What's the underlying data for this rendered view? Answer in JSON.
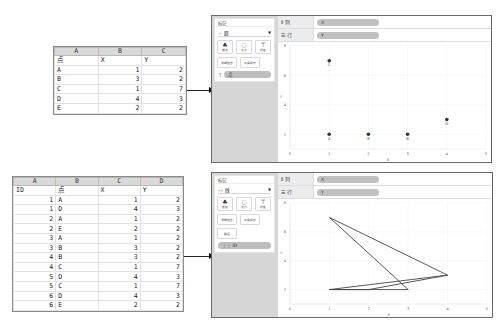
{
  "sheet1": {
    "columns": [
      "A",
      "B",
      "C"
    ],
    "rows": [
      [
        "点",
        "X",
        "Y"
      ],
      [
        "A",
        "1",
        "2"
      ],
      [
        "B",
        "3",
        "2"
      ],
      [
        "C",
        "1",
        "7"
      ],
      [
        "D",
        "4",
        "3"
      ],
      [
        "E",
        "2",
        "2"
      ]
    ]
  },
  "sheet2": {
    "columns": [
      "A",
      "B",
      "C",
      "D"
    ],
    "rows": [
      [
        "ID",
        "点",
        "X",
        "Y"
      ],
      [
        "1",
        "A",
        "1",
        "2"
      ],
      [
        "1",
        "D",
        "4",
        "3"
      ],
      [
        "2",
        "A",
        "1",
        "2"
      ],
      [
        "2",
        "E",
        "2",
        "2"
      ],
      [
        "3",
        "A",
        "1",
        "2"
      ],
      [
        "3",
        "B",
        "3",
        "2"
      ],
      [
        "4",
        "B",
        "3",
        "2"
      ],
      [
        "4",
        "C",
        "1",
        "7"
      ],
      [
        "5",
        "D",
        "4",
        "3"
      ],
      [
        "5",
        "C",
        "1",
        "7"
      ],
      [
        "6",
        "D",
        "4",
        "3"
      ],
      [
        "6",
        "E",
        "2",
        "2"
      ]
    ]
  },
  "panel1": {
    "marks_title": "标记",
    "mark_type": "圆",
    "mark_type_icon": "scatter-icon",
    "buttons": [
      {
        "icon": "color-icon",
        "label": "颜色"
      },
      {
        "icon": "size-icon",
        "label": "大小"
      },
      {
        "icon": "label-icon",
        "label": "标签"
      },
      {
        "icon": "detail-icon",
        "label": "详细信息"
      },
      {
        "icon": "tooltip-icon",
        "label": "工具提示"
      }
    ],
    "pill_icon": "label-icon",
    "pill_label": "点",
    "columns_shelf": {
      "label": "列",
      "pill": "X"
    },
    "rows_shelf": {
      "label": "行",
      "pill": "Y"
    },
    "axis": {
      "x_title": "X",
      "y_title": "Y"
    }
  },
  "panel2": {
    "marks_title": "标记",
    "mark_type": "线",
    "mark_type_icon": "line-icon",
    "buttons": [
      {
        "icon": "color-icon",
        "label": "颜色"
      },
      {
        "icon": "size-icon",
        "label": "大小"
      },
      {
        "icon": "label-icon",
        "label": "标签"
      },
      {
        "icon": "detail-icon",
        "label": "详细信息"
      },
      {
        "icon": "tooltip-icon",
        "label": "工具提示"
      },
      {
        "icon": "path-icon",
        "label": "路径"
      }
    ],
    "pill_icon": "detail-icon",
    "pill_label": "ID",
    "columns_shelf": {
      "label": "列",
      "pill": "X"
    },
    "rows_shelf": {
      "label": "行",
      "pill": "Y"
    },
    "axis": {
      "x_title": "X",
      "y_title": "Y"
    }
  },
  "chart_data": [
    {
      "type": "scatter",
      "title": "",
      "xlabel": "X",
      "ylabel": "Y",
      "xlim": [
        0,
        5
      ],
      "ylim": [
        1,
        8
      ],
      "x_ticks": [
        "0",
        "1",
        "2",
        "3",
        "4",
        "5"
      ],
      "y_ticks": [
        "2",
        "4",
        "6",
        "8"
      ],
      "points": [
        {
          "label": "A",
          "x": 1,
          "y": 2
        },
        {
          "label": "B",
          "x": 3,
          "y": 2
        },
        {
          "label": "C",
          "x": 1,
          "y": 7
        },
        {
          "label": "D",
          "x": 4,
          "y": 3
        },
        {
          "label": "E",
          "x": 2,
          "y": 2
        }
      ],
      "grid": true
    },
    {
      "type": "line",
      "title": "",
      "xlabel": "X",
      "ylabel": "Y",
      "xlim": [
        0,
        5
      ],
      "ylim": [
        1,
        8
      ],
      "x_ticks": [
        "0",
        "1",
        "2",
        "3",
        "4",
        "5"
      ],
      "y_ticks": [
        "2",
        "4",
        "6",
        "8"
      ],
      "series": [
        {
          "name": "1",
          "points": [
            [
              1,
              2
            ],
            [
              4,
              3
            ]
          ]
        },
        {
          "name": "2",
          "points": [
            [
              1,
              2
            ],
            [
              2,
              2
            ]
          ]
        },
        {
          "name": "3",
          "points": [
            [
              1,
              2
            ],
            [
              3,
              2
            ]
          ]
        },
        {
          "name": "4",
          "points": [
            [
              3,
              2
            ],
            [
              1,
              7
            ]
          ]
        },
        {
          "name": "5",
          "points": [
            [
              4,
              3
            ],
            [
              1,
              7
            ]
          ]
        },
        {
          "name": "6",
          "points": [
            [
              4,
              3
            ],
            [
              2,
              2
            ]
          ]
        }
      ],
      "grid": true
    }
  ]
}
